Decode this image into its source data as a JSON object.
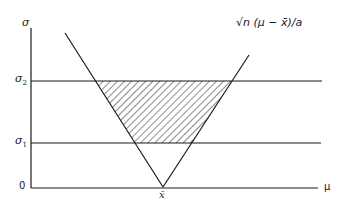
{
  "diagram": {
    "y_axis": {
      "label": "σ",
      "ticks": [
        {
          "label": "σ",
          "sub": "2"
        },
        {
          "label": "σ",
          "sub": "1"
        },
        {
          "label": "0",
          "sub": ""
        }
      ]
    },
    "x_axis": {
      "label": "μ",
      "vertex_label": "x̄"
    },
    "curve_label": "√n (μ − x̄)/a",
    "hatched_region": "region between σ1 and σ2 bounded by the V-shaped curve",
    "colors": {
      "line": "#1a1a1a",
      "background": "#ffffff"
    }
  }
}
